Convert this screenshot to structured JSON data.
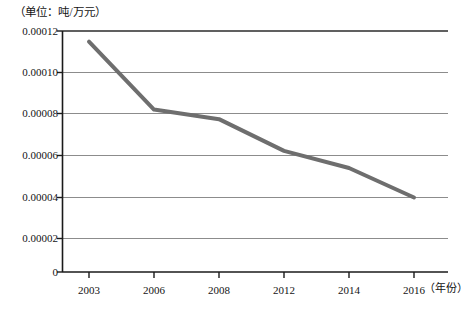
{
  "chart_data": {
    "type": "line",
    "title": "",
    "unit_caption": "（单位：吨/万元）",
    "xlabel": "（年份）",
    "ylabel": "",
    "categories": [
      "2003",
      "2006",
      "2008",
      "2012",
      "2014",
      "2016"
    ],
    "x": [
      2003,
      2006,
      2008,
      2012,
      2014,
      2016
    ],
    "values": [
      0.0001147,
      8.09e-05,
      7.61e-05,
      6.03e-05,
      5.18e-05,
      3.71e-05
    ],
    "series": [
      {
        "name": "单位产值能耗",
        "values": [
          0.0001147,
          8.09e-05,
          7.61e-05,
          6.03e-05,
          5.18e-05,
          3.71e-05
        ]
      }
    ],
    "ylim": [
      0,
      0.00012
    ],
    "ytick_labels": [
      "0.00012",
      "0.00010",
      "0.00008",
      "0.00006",
      "0.00004",
      "0.00002",
      "0"
    ],
    "ytick_values": [
      0.00012,
      0.0001,
      8e-05,
      6e-05,
      4e-05,
      2e-05,
      0
    ],
    "xtick_labels": [
      "2003",
      "2006",
      "2008",
      "2012",
      "2014",
      "2016"
    ],
    "grid": true,
    "grid_axis": "y",
    "legend": false,
    "legend_position": "none",
    "line_color": "#6e6e6e",
    "line_width": 4,
    "grid_color": "#8c8c8c",
    "axis_color": "#1a1a1a",
    "background": "#ffffff"
  }
}
